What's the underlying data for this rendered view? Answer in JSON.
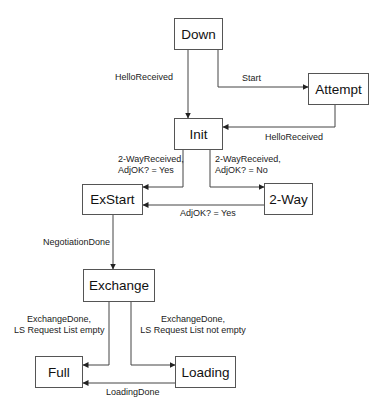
{
  "diagram": {
    "type": "state-machine",
    "nodes": {
      "down": "Down",
      "attempt": "Attempt",
      "init": "Init",
      "exstart": "ExStart",
      "twoway": "2-Way",
      "exchange": "Exchange",
      "full": "Full",
      "loading": "Loading"
    },
    "edges": [
      {
        "from": "Down",
        "to": "Init",
        "label": "HelloReceived"
      },
      {
        "from": "Down",
        "to": "Attempt",
        "label": "Start"
      },
      {
        "from": "Attempt",
        "to": "Init",
        "label": "HelloReceived"
      },
      {
        "from": "Init",
        "to": "ExStart",
        "label_line1": "2-WayReceived,",
        "label_line2": "AdjOK? = Yes"
      },
      {
        "from": "Init",
        "to": "2-Way",
        "label_line1": "2-WayReceived,",
        "label_line2": "AdjOK? = No"
      },
      {
        "from": "2-Way",
        "to": "ExStart",
        "label": "AdjOK? = Yes"
      },
      {
        "from": "ExStart",
        "to": "Exchange",
        "label": "NegotiationDone"
      },
      {
        "from": "Exchange",
        "to": "Full",
        "label_line1": "ExchangeDone,",
        "label_line2": "LS Request List empty"
      },
      {
        "from": "Exchange",
        "to": "Loading",
        "label_line1": "ExchangeDone,",
        "label_line2": "LS Request List not empty"
      },
      {
        "from": "Loading",
        "to": "Full",
        "label": "LoadingDone"
      }
    ]
  }
}
